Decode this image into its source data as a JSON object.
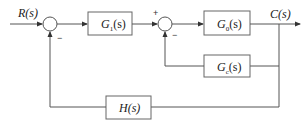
{
  "diagram": {
    "type": "control-system-block-diagram",
    "input": {
      "label": "R(s)"
    },
    "output": {
      "label": "C(s)"
    },
    "summing_junctions": [
      {
        "id": "sum1",
        "inputs": [
          {
            "from": "R(s)",
            "sign": ""
          },
          {
            "from": "H(s)",
            "sign": "−"
          }
        ]
      },
      {
        "id": "sum2",
        "inputs": [
          {
            "from": "G1(s)",
            "sign": "+"
          },
          {
            "from": "Gc(s)",
            "sign": "−"
          }
        ]
      }
    ],
    "blocks": [
      {
        "id": "G1",
        "name": "G",
        "sub": "1",
        "arg": "(s)"
      },
      {
        "id": "G0",
        "name": "G",
        "sub": "0",
        "arg": "(s)"
      },
      {
        "id": "Gc",
        "name": "G",
        "sub": "c",
        "arg": "(s)"
      },
      {
        "id": "H",
        "name": "H",
        "sub": "",
        "arg": "(s)"
      }
    ],
    "signs": {
      "sum1_minus": "−",
      "sum2_plus": "+",
      "sum2_minus": "−"
    }
  }
}
